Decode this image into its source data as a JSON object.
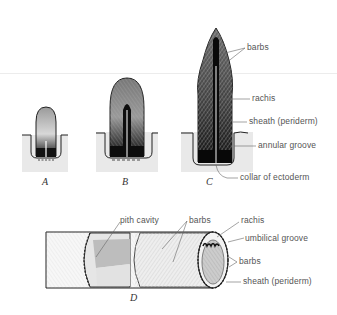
{
  "figure": {
    "panels": [
      {
        "id": "A",
        "caption": "A"
      },
      {
        "id": "B",
        "caption": "B"
      },
      {
        "id": "C",
        "caption": "C"
      },
      {
        "id": "D",
        "caption": "D"
      }
    ],
    "labels_c": {
      "barbs": "barbs",
      "rachis": "rachis",
      "sheath": "sheath (periderm)",
      "annular_groove": "annular groove",
      "collar": "collar of ectoderm"
    },
    "labels_d": {
      "pith_cavity": "pith cavity",
      "barbs_middle": "barbs",
      "rachis": "rachis",
      "umbilical_groove": "umbilical groove",
      "barbs_right": "barbs",
      "sheath": "sheath (periderm)"
    },
    "colors": {
      "ink": "#1a1a1a",
      "ground": "#e9e9e9",
      "label": "#555555",
      "leader": "#666666"
    }
  }
}
